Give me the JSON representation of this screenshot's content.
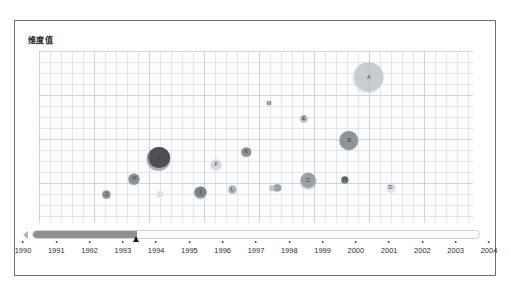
{
  "chart": {
    "title": "维度值",
    "plot_background": "#fdfdfe",
    "grid": true
  },
  "timeline": {
    "left_arrow_icon": "triangle-left-icon",
    "right_arrow_icon": "triangle-right-icon",
    "handle_icon": "slider-handle-icon",
    "current_value": "1993.5",
    "fill_percent": 23.3,
    "range_start": "1990",
    "range_end": "2004",
    "track_color": "#8f8f8f"
  },
  "chart_data": {
    "type": "scatter",
    "title": "维度值",
    "xlabel": "",
    "ylabel": "",
    "xlim": [
      1990,
      2004
    ],
    "ylim": [
      0,
      100
    ],
    "grid": true,
    "legend": "none",
    "tick_labels": [
      "1990",
      "1991",
      "1992",
      "1993",
      "1994",
      "1995",
      "1996",
      "1997",
      "1998",
      "1999",
      "2000",
      "2001",
      "2002",
      "2003",
      "2004"
    ],
    "points": [
      {
        "label": "A",
        "x": 2001.1,
        "y": 76,
        "size": 31,
        "color": "#c9cdd2",
        "px": 76.0,
        "py": 15.0,
        "r": 15.5
      },
      {
        "label": "B",
        "x": 2000.3,
        "y": 42,
        "size": 20,
        "color": "#8e939a",
        "px": 71.5,
        "py": 52.0,
        "r": 10.0
      },
      {
        "label": "C",
        "x": 1999.0,
        "y": 22,
        "size": 17,
        "color": "#9aa0a6",
        "px": 62.0,
        "py": 75.0,
        "r": 8.5
      },
      {
        "label": "D",
        "x": 2002.0,
        "y": 19,
        "size": 10,
        "color": "#dcdfe3",
        "px": 81.0,
        "py": 79.5,
        "r": 5.0
      },
      {
        "label": "E",
        "x": 1998.7,
        "y": 54,
        "size": 8,
        "color": "#b3b8be",
        "px": 61.0,
        "py": 39.5,
        "r": 4.0
      },
      {
        "label": "F",
        "x": 1995.5,
        "y": 31,
        "size": 12,
        "color": "#d4d8dc",
        "px": 40.8,
        "py": 66.0,
        "r": 6.0
      },
      {
        "label": "G",
        "x": 1993.4,
        "y": 34,
        "size": 24,
        "color": "#4e5055",
        "px": 27.6,
        "py": 62.0,
        "r": 12.0
      },
      {
        "label": "H",
        "x": 1992.4,
        "y": 22,
        "size": 12,
        "color": "#8b9096",
        "px": 22.0,
        "py": 74.5,
        "r": 6.0
      },
      {
        "label": "I",
        "x": 1995.0,
        "y": 16,
        "size": 13,
        "color": "#7c8187",
        "px": 37.2,
        "py": 82.0,
        "r": 6.5
      },
      {
        "label": "J",
        "x": 1991.3,
        "y": 15,
        "size": 9,
        "color": "#8a8f95",
        "px": 15.5,
        "py": 83.5,
        "r": 4.5
      },
      {
        "label": "K",
        "x": 1996.6,
        "y": 38,
        "size": 10,
        "color": "#8b9096",
        "px": 47.8,
        "py": 58.5,
        "r": 5.0
      },
      {
        "label": "L",
        "x": 1996.2,
        "y": 18,
        "size": 9,
        "color": "#aeb3b9",
        "px": 44.5,
        "py": 80.5,
        "r": 4.5
      },
      {
        "label": "M",
        "x": 1997.2,
        "y": 61,
        "size": 6,
        "color": "#e2e5e8",
        "px": 53.0,
        "py": 30.5,
        "r": 3.0
      },
      {
        "label": "N",
        "x": 2000.3,
        "y": 22,
        "size": 8,
        "color": "#6f7479",
        "px": 70.5,
        "py": 75.0,
        "r": 4.0
      },
      {
        "label": "",
        "x": 1993.5,
        "y": 15,
        "size": 7,
        "color": "#dfe2e6",
        "px": 27.8,
        "py": 83.5,
        "r": 3.5
      },
      {
        "label": "",
        "x": 1997.5,
        "y": 19,
        "size": 8,
        "color": "#9aa0a6",
        "px": 54.9,
        "py": 79.5,
        "r": 4.0
      },
      {
        "label": "",
        "x": 1997.4,
        "y": 19,
        "size": 6,
        "color": "#bfc4c9",
        "px": 53.6,
        "py": 79.8,
        "r": 3.0
      }
    ]
  }
}
